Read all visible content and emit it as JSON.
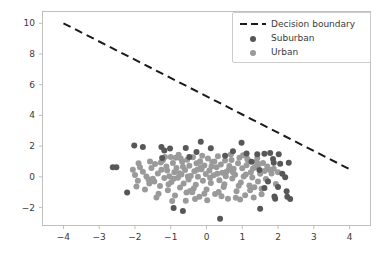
{
  "chart_data": {
    "type": "scatter",
    "title": "",
    "xlabel": "",
    "ylabel": "",
    "xlim": [
      -4.6,
      4.6
    ],
    "ylim": [
      -3.2,
      10.8
    ],
    "grid": false,
    "legend_position": "upper right",
    "xticks": [
      "−4",
      "−3",
      "−2",
      "−1",
      "0",
      "1",
      "2",
      "3",
      "4"
    ],
    "xtick_values": [
      -4,
      -3,
      -2,
      -1,
      0,
      1,
      2,
      3,
      4
    ],
    "yticks": [
      "−2",
      "0",
      "2",
      "4",
      "6",
      "8",
      "10"
    ],
    "ytick_values": [
      -2,
      0,
      2,
      4,
      6,
      8,
      10
    ],
    "colors": {
      "suburban": "#575757",
      "urban": "#9a9a9a",
      "decision_boundary": "#1a1a1a",
      "axes": "#bfbfbf",
      "text": "#3a3a3a",
      "background": "#ffffff"
    },
    "annotations": [],
    "series": [
      {
        "name": "Decision boundary",
        "type": "line",
        "style": "dashed",
        "color": "#1a1a1a",
        "linewidth": 2,
        "x": [
          -4,
          4
        ],
        "y": [
          10,
          0.5
        ]
      },
      {
        "name": "Suburban",
        "type": "scatter",
        "color": "#575757",
        "marker": "o",
        "size": 6,
        "points": [
          [
            -2.62,
            0.62
          ],
          [
            -2.52,
            0.63
          ],
          [
            -2.22,
            -1.02
          ],
          [
            -2.02,
            2.05
          ],
          [
            -1.78,
            1.95
          ],
          [
            -1.26,
            1.95
          ],
          [
            -1.18,
            1.72
          ],
          [
            -1.02,
            1.84
          ],
          [
            -0.92,
            -2.02
          ],
          [
            -0.66,
            -2.22
          ],
          [
            -0.58,
            1.88
          ],
          [
            -0.28,
            1.62
          ],
          [
            -0.16,
            2.28
          ],
          [
            0.12,
            1.86
          ],
          [
            0.38,
            -2.72
          ],
          [
            0.74,
            1.66
          ],
          [
            0.98,
            2.22
          ],
          [
            1.12,
            1.52
          ],
          [
            1.42,
            1.48
          ],
          [
            1.5,
            -2.08
          ],
          [
            1.62,
            1.5
          ],
          [
            1.78,
            1.56
          ],
          [
            1.86,
            1.16
          ],
          [
            1.88,
            0.92
          ],
          [
            1.9,
            -1.28
          ],
          [
            1.92,
            -1.42
          ],
          [
            2.02,
            1.48
          ],
          [
            2.06,
            0.86
          ],
          [
            2.12,
            0.2
          ],
          [
            2.2,
            -0.02
          ],
          [
            2.24,
            -0.94
          ],
          [
            2.26,
            -1.3
          ],
          [
            2.3,
            0.92
          ],
          [
            2.34,
            -1.44
          ],
          [
            1.48,
            0.44
          ],
          [
            1.62,
            -0.72
          ],
          [
            1.72,
            -0.3
          ],
          [
            2.0,
            -0.66
          ],
          [
            -1.24,
            1.22
          ],
          [
            -0.48,
            1.3
          ],
          [
            0.52,
            1.38
          ],
          [
            1.26,
            0.98
          ]
        ]
      },
      {
        "name": "Urban",
        "type": "scatter",
        "color": "#9a9a9a",
        "marker": "o",
        "size": 6,
        "points": [
          [
            -2.0,
            0.12
          ],
          [
            -1.92,
            -0.26
          ],
          [
            -1.78,
            0.34
          ],
          [
            -1.68,
            0.02
          ],
          [
            -1.6,
            -0.44
          ],
          [
            -1.54,
            0.58
          ],
          [
            -1.5,
            -0.12
          ],
          [
            -1.44,
            0.84
          ],
          [
            -1.4,
            -1.34
          ],
          [
            -1.36,
            0.22
          ],
          [
            -1.3,
            -0.6
          ],
          [
            -1.26,
            0.46
          ],
          [
            -1.22,
            1.08
          ],
          [
            -1.18,
            -0.08
          ],
          [
            -1.12,
            0.68
          ],
          [
            -1.08,
            -0.88
          ],
          [
            -1.04,
            0.04
          ],
          [
            -1.0,
            1.3
          ],
          [
            -0.98,
            -0.34
          ],
          [
            -0.94,
            0.9
          ],
          [
            -0.9,
            0.3
          ],
          [
            -0.88,
            -1.22
          ],
          [
            -0.84,
            0.58
          ],
          [
            -0.8,
            -0.06
          ],
          [
            -0.78,
            1.44
          ],
          [
            -0.74,
            -0.7
          ],
          [
            -0.7,
            0.16
          ],
          [
            -0.68,
            0.98
          ],
          [
            -0.64,
            -0.44
          ],
          [
            -0.6,
            0.44
          ],
          [
            -0.58,
            -1.56
          ],
          [
            -0.54,
            1.12
          ],
          [
            -0.5,
            -0.18
          ],
          [
            -0.48,
            0.72
          ],
          [
            -0.44,
            0.06
          ],
          [
            -0.4,
            -1.0
          ],
          [
            -0.38,
            1.28
          ],
          [
            -0.34,
            0.36
          ],
          [
            -0.3,
            -0.52
          ],
          [
            -0.28,
            0.88
          ],
          [
            -0.24,
            0.0
          ],
          [
            -0.2,
            -1.3
          ],
          [
            -0.18,
            1.02
          ],
          [
            -0.14,
            0.5
          ],
          [
            -0.1,
            -0.26
          ],
          [
            -0.06,
            0.74
          ],
          [
            -0.02,
            0.18
          ],
          [
            0.0,
            -0.82
          ],
          [
            0.04,
            1.2
          ],
          [
            0.08,
            0.42
          ],
          [
            0.12,
            -0.4
          ],
          [
            0.16,
            0.96
          ],
          [
            0.2,
            0.1
          ],
          [
            0.24,
            -1.12
          ],
          [
            0.28,
            0.62
          ],
          [
            0.32,
            1.34
          ],
          [
            0.36,
            -0.22
          ],
          [
            0.4,
            0.8
          ],
          [
            0.44,
            0.26
          ],
          [
            0.48,
            -0.66
          ],
          [
            0.52,
            1.06
          ],
          [
            0.56,
            0.34
          ],
          [
            0.6,
            -1.42
          ],
          [
            0.64,
            0.7
          ],
          [
            0.68,
            1.46
          ],
          [
            0.72,
            -0.1
          ],
          [
            0.76,
            0.52
          ],
          [
            0.8,
            0.14
          ],
          [
            0.84,
            -0.94
          ],
          [
            0.88,
            0.88
          ],
          [
            0.92,
            1.24
          ],
          [
            0.96,
            -0.36
          ],
          [
            1.0,
            0.56
          ],
          [
            1.04,
            0.02
          ],
          [
            1.08,
            -1.2
          ],
          [
            1.12,
            0.76
          ],
          [
            1.16,
            1.08
          ],
          [
            1.2,
            -0.56
          ],
          [
            1.24,
            0.3
          ],
          [
            1.28,
            -0.04
          ],
          [
            1.32,
            -1.34
          ],
          [
            1.36,
            0.64
          ],
          [
            1.4,
            1.0
          ],
          [
            1.44,
            -0.3
          ],
          [
            1.5,
            0.2
          ],
          [
            1.54,
            -0.78
          ],
          [
            1.58,
            0.9
          ],
          [
            1.62,
            0.38
          ],
          [
            1.66,
            -0.14
          ],
          [
            1.7,
            0.68
          ],
          [
            1.76,
            0.46
          ],
          [
            1.82,
            0.22
          ],
          [
            1.88,
            0.52
          ],
          [
            -1.86,
            0.62
          ],
          [
            -1.72,
            -0.82
          ],
          [
            -1.58,
            1.0
          ],
          [
            -1.46,
            -0.3
          ],
          [
            -1.34,
            -1.1
          ],
          [
            -1.16,
            1.3
          ],
          [
            -0.96,
            -1.58
          ],
          [
            -0.76,
            0.24
          ],
          [
            -0.56,
            -1.02
          ],
          [
            -0.36,
            -0.76
          ],
          [
            -0.16,
            0.62
          ],
          [
            0.02,
            -1.52
          ],
          [
            0.22,
            1.0
          ],
          [
            0.42,
            -1.26
          ],
          [
            0.62,
            0.46
          ],
          [
            0.82,
            -1.36
          ],
          [
            1.02,
            1.4
          ],
          [
            1.22,
            -0.88
          ],
          [
            1.42,
            1.22
          ],
          [
            1.54,
            -1.14
          ],
          [
            -1.1,
            0.42
          ],
          [
            -0.92,
            -0.12
          ],
          [
            -0.72,
            1.2
          ],
          [
            -0.52,
            0.02
          ],
          [
            -0.32,
            -1.44
          ],
          [
            -0.12,
            1.38
          ],
          [
            0.1,
            -0.06
          ],
          [
            0.3,
            0.2
          ],
          [
            0.5,
            -0.48
          ],
          [
            0.7,
            1.1
          ],
          [
            0.9,
            -0.58
          ],
          [
            1.1,
            0.16
          ],
          [
            1.3,
            0.54
          ],
          [
            -1.62,
            -0.18
          ],
          [
            -1.28,
            0.94
          ],
          [
            -1.06,
            -0.48
          ],
          [
            -0.86,
            1.24
          ],
          [
            -0.66,
            0.66
          ],
          [
            -0.46,
            -0.92
          ],
          [
            -0.26,
            0.46
          ],
          [
            -0.06,
            -1.1
          ],
          [
            0.14,
            0.68
          ],
          [
            0.34,
            -0.98
          ],
          [
            0.54,
            0.04
          ],
          [
            0.74,
            0.3
          ],
          [
            0.94,
            -1.48
          ],
          [
            1.14,
            1.18
          ],
          [
            1.34,
            -0.68
          ],
          [
            1.46,
            0.82
          ],
          [
            -1.96,
            -0.62
          ],
          [
            -2.06,
            0.46
          ],
          [
            -1.9,
            0.88
          ],
          [
            2.0,
            0.3
          ],
          [
            1.94,
            -0.46
          ]
        ]
      }
    ]
  }
}
